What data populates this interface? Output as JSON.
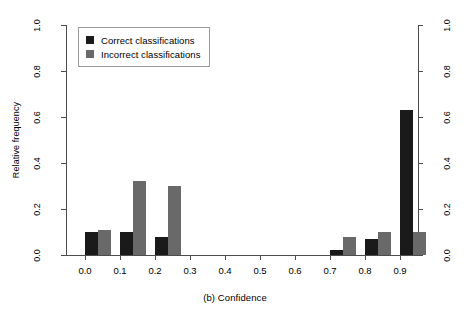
{
  "chart_data": {
    "type": "bar",
    "title": "",
    "xlabel": "(b) Confidence",
    "ylabel": "Relative frequency",
    "categories": [
      "0.0",
      "0.1",
      "0.2",
      "0.3",
      "0.4",
      "0.5",
      "0.6",
      "0.7",
      "0.8",
      "0.9"
    ],
    "series": [
      {
        "name": "Correct classifications",
        "color": "#1a1a1a",
        "values": [
          0.1,
          0.1,
          0.08,
          0.0,
          0.0,
          0.0,
          0.0,
          0.02,
          0.07,
          0.63
        ]
      },
      {
        "name": "Incorrect classifications",
        "color": "#696969",
        "values": [
          0.11,
          0.32,
          0.3,
          0.0,
          0.0,
          0.0,
          0.0,
          0.08,
          0.1,
          0.1
        ]
      }
    ],
    "ylim": [
      0.0,
      1.0
    ],
    "yticks": [
      "0.0",
      "0.2",
      "0.4",
      "0.6",
      "0.8",
      "1.0"
    ],
    "ytick_values": [
      0.0,
      0.2,
      0.4,
      0.6,
      0.8,
      1.0
    ],
    "xticks": [
      "0.0",
      "0.1",
      "0.2",
      "0.3",
      "0.4",
      "0.5",
      "0.6",
      "0.7",
      "0.8",
      "0.9"
    ],
    "grid": false,
    "legend_position": "top-left",
    "right_axis": true,
    "right_yticks": [
      "0.0",
      "0.2",
      "0.4",
      "0.6",
      "0.8",
      "1.0"
    ]
  },
  "legend": {
    "items": [
      {
        "label": "Correct classifications",
        "swatch": "correct"
      },
      {
        "label": "Incorrect classifications",
        "swatch": "incorrect"
      }
    ]
  },
  "axes": {
    "y_title": "Relative frequency",
    "x_title": "(b) Confidence"
  }
}
